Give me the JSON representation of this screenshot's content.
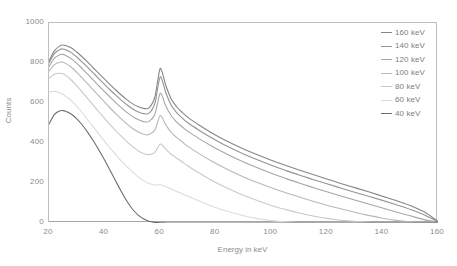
{
  "chart_data": {
    "type": "line",
    "title": "",
    "xlabel": "Energy in keV",
    "ylabel": "Counts",
    "xlim": [
      20,
      160
    ],
    "ylim": [
      0,
      1000
    ],
    "xticks": [
      20,
      40,
      60,
      80,
      100,
      120,
      140,
      160
    ],
    "yticks": [
      0,
      200,
      400,
      600,
      800,
      1000
    ],
    "grid": false,
    "legend_position": "top-right",
    "annotations": [],
    "x": [
      20,
      22,
      24,
      25,
      26,
      28,
      30,
      32,
      34,
      36,
      38,
      40,
      42,
      44,
      46,
      48,
      50,
      52,
      54,
      56,
      58,
      59,
      60,
      61,
      62,
      64,
      66,
      68,
      70,
      74,
      78,
      82,
      86,
      90,
      95,
      100,
      105,
      110,
      115,
      120,
      125,
      130,
      135,
      140,
      145,
      150,
      155,
      160
    ],
    "series": [
      {
        "name": "160 keV",
        "color": "#878787",
        "values": [
          810,
          862,
          886,
          890,
          888,
          876,
          855,
          830,
          803,
          775,
          747,
          719,
          692,
          665,
          640,
          617,
          597,
          582,
          573,
          576,
          625,
          700,
          772,
          742,
          690,
          620,
          580,
          552,
          528,
          490,
          455,
          424,
          396,
          370,
          341,
          314,
          289,
          265,
          242,
          220,
          198,
          177,
          156,
          134,
          112,
          87,
          56,
          8
        ]
      },
      {
        "name": "140 keV",
        "color": "#949494",
        "values": [
          800,
          848,
          868,
          870,
          866,
          852,
          830,
          804,
          777,
          749,
          721,
          693,
          665,
          639,
          614,
          591,
          571,
          556,
          547,
          549,
          594,
          664,
          730,
          702,
          654,
          589,
          551,
          524,
          501,
          464,
          430,
          399,
          371,
          345,
          316,
          289,
          264,
          240,
          218,
          196,
          175,
          154,
          134,
          113,
          91,
          68,
          41,
          6
        ]
      },
      {
        "name": "120 keV",
        "color": "#a6a6a6",
        "values": [
          782,
          824,
          842,
          843,
          838,
          822,
          798,
          771,
          743,
          714,
          685,
          657,
          629,
          602,
          577,
          553,
          533,
          517,
          507,
          508,
          540,
          594,
          648,
          625,
          586,
          536,
          504,
          480,
          458,
          422,
          389,
          359,
          331,
          305,
          276,
          249,
          224,
          200,
          178,
          156,
          135,
          115,
          95,
          75,
          55,
          36,
          17,
          4
        ]
      },
      {
        "name": "100 keV",
        "color": "#b8b8b8",
        "values": [
          760,
          792,
          804,
          804,
          798,
          779,
          753,
          724,
          694,
          664,
          634,
          604,
          575,
          547,
          521,
          496,
          474,
          456,
          444,
          442,
          463,
          500,
          537,
          520,
          492,
          453,
          427,
          405,
          383,
          347,
          314,
          284,
          256,
          230,
          202,
          176,
          152,
          130,
          109,
          89,
          71,
          54,
          38,
          24,
          13,
          6,
          2,
          0
        ]
      },
      {
        "name": "80 keV",
        "color": "#c9c9c9",
        "values": [
          724,
          744,
          749,
          746,
          738,
          715,
          686,
          654,
          621,
          588,
          555,
          523,
          492,
          462,
          434,
          407,
          383,
          362,
          347,
          342,
          352,
          373,
          395,
          386,
          369,
          344,
          324,
          305,
          285,
          250,
          218,
          189,
          163,
          139,
          112,
          88,
          68,
          50,
          35,
          23,
          14,
          8,
          4,
          2,
          1,
          0,
          0,
          0
        ]
      },
      {
        "name": "60 keV",
        "color": "#dcdcdc",
        "values": [
          655,
          658,
          650,
          643,
          634,
          612,
          583,
          550,
          515,
          479,
          443,
          408,
          374,
          342,
          311,
          283,
          256,
          232,
          212,
          197,
          190,
          190,
          191,
          188,
          182,
          170,
          158,
          146,
          134,
          110,
          88,
          68,
          51,
          36,
          22,
          12,
          6,
          2,
          1,
          0,
          0,
          0,
          0,
          0,
          0,
          0,
          0,
          0
        ]
      },
      {
        "name": "40 keV",
        "color": "#6e6e6e",
        "values": [
          494,
          543,
          561,
          562,
          559,
          545,
          521,
          490,
          452,
          410,
          364,
          315,
          263,
          210,
          158,
          110,
          70,
          41,
          21,
          9,
          3,
          2,
          1,
          1,
          0,
          0,
          0,
          0,
          0,
          0,
          0,
          0,
          0,
          0,
          0,
          0,
          0,
          0,
          0,
          0,
          0,
          0,
          0,
          0,
          0,
          0,
          0,
          0
        ]
      }
    ]
  },
  "legend": {
    "items": [
      {
        "label": "160 keV"
      },
      {
        "label": "140 keV"
      },
      {
        "label": "120 keV"
      },
      {
        "label": "100 keV"
      },
      {
        "label": "80 keV"
      },
      {
        "label": "60 keV"
      },
      {
        "label": "40 keV"
      }
    ]
  },
  "axes": {
    "x_tick_labels": [
      "20",
      "40",
      "60",
      "80",
      "100",
      "120",
      "140",
      "160"
    ],
    "y_tick_labels": [
      "1000",
      "800",
      "600",
      "400",
      "200",
      "0"
    ],
    "x_title": "Energy in keV",
    "y_title": "Counts"
  },
  "colors": {
    "frame": "#bfbfbf",
    "tick_text": "#8c8c8c",
    "background": "#ffffff"
  }
}
